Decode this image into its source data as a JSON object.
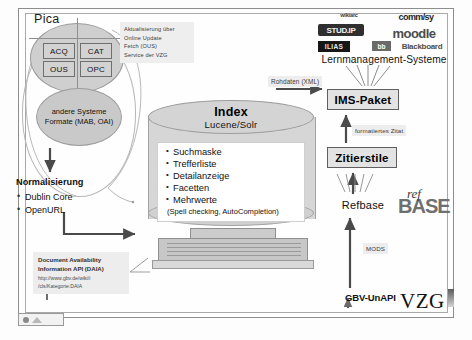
{
  "diagram": {
    "pica": {
      "label": "Pica",
      "modules": [
        {
          "id": "acq",
          "label": "ACQ"
        },
        {
          "id": "cat",
          "label": "CAT"
        },
        {
          "id": "ous",
          "label": "OUS"
        },
        {
          "id": "opc",
          "label": "OPC"
        }
      ],
      "other_systems": {
        "line1": "andere Systeme",
        "line2": "Formate (MAB, OAI)"
      },
      "update_note": "Aktualisierung über\nOnline Update\nFetch (OUS)\nService der VZG",
      "update_note_lines": [
        "Aktualisierung über",
        "Online Update",
        "Fetch (OUS)",
        "Service der VZG"
      ]
    },
    "normalisierung": {
      "title": "Normalisierung",
      "items": [
        "Dublin Core",
        "OpenURL"
      ]
    },
    "daia": {
      "title_line1": "Document Availability",
      "title_line2": "Information API (DAIA)",
      "url_line1": "http://www.gbv.de/wiki/i",
      "url_line2": "/cls/Kategorie:DAIA"
    },
    "index": {
      "title": "Index",
      "subtitle": "Lucene/Solr",
      "features": [
        "Suchmaske",
        "Trefferliste",
        "Detailanzeige",
        "Facetten",
        "Mehrwerte"
      ],
      "features_note": "(Spell checking, AutoCompletion)"
    },
    "right_column": {
      "ims_paket": "IMS-Paket",
      "zitierstile": "Zitierstile",
      "refbase": "Refbase",
      "lms_title": "Lernmanagement-Systeme"
    },
    "edge_labels": {
      "rohdaten": "Rohdaten (XML)",
      "formatiertes_zitat": "formatiertes Zitat",
      "mods": "MODS",
      "gbv_unapi": "GBV-UnAPI"
    },
    "logos": {
      "wikiarc": "wikiarc",
      "stud_ip": "STUD.IP",
      "commsy": "comm/sy",
      "moodle": "moodle",
      "ilias": "ILIAS",
      "blackboard_badge": "bb",
      "blackboard": "Blackboard",
      "refbase_ref": "ref",
      "refbase_base": "BASE",
      "vzg": "VZG"
    }
  },
  "colors": {
    "fill_grey": "#d0d0d0",
    "stroke_grey": "#8f8f8f",
    "label_bg": "#ededed",
    "page_bg": "#fefefe"
  }
}
